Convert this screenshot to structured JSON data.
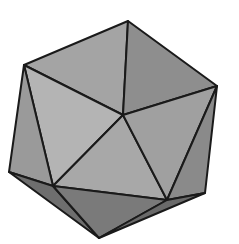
{
  "figure": {
    "background": "#ffffff",
    "stroke_color": "#1a1a1a",
    "vertices": {
      "top": [
        128,
        21
      ],
      "upper_left": [
        24,
        65
      ],
      "right": [
        217,
        86
      ],
      "center": [
        123,
        115
      ],
      "left": [
        9,
        172
      ],
      "inner_left": [
        53,
        186
      ],
      "inner_right": [
        167,
        200
      ],
      "lower_right": [
        205,
        193
      ],
      "bottom": [
        99,
        238
      ]
    },
    "faces": [
      {
        "name": "top-left-face",
        "fill": "#a4a4a4"
      },
      {
        "name": "top-right-face",
        "fill": "#8e8e8e"
      },
      {
        "name": "left-upper-face",
        "fill": "#b4b4b4"
      },
      {
        "name": "left-outer-face",
        "fill": "#9a9a9a"
      },
      {
        "name": "center-lower-face",
        "fill": "#a8a8a8"
      },
      {
        "name": "right-middle-face",
        "fill": "#a0a0a0"
      },
      {
        "name": "right-outer-face",
        "fill": "#8a8a8a"
      },
      {
        "name": "bottom-left-face",
        "fill": "#6e6e6e"
      },
      {
        "name": "bottom-middle-face",
        "fill": "#7a7a7a"
      },
      {
        "name": "bottom-right-face",
        "fill": "#6a6a6a"
      }
    ]
  }
}
